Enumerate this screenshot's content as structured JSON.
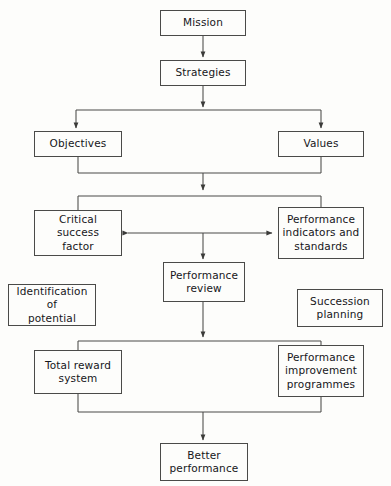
{
  "diagram": {
    "background_color": "#fdfdfb",
    "line_color": "#4a4a48",
    "text_color": "#16161a",
    "nodes": [
      {
        "id": "mission",
        "label": "Mission",
        "x": 160,
        "y": 10,
        "w": 86,
        "h": 26
      },
      {
        "id": "strategies",
        "label": "Strategies",
        "x": 160,
        "y": 60,
        "w": 86,
        "h": 26
      },
      {
        "id": "objectives",
        "label": "Objectives",
        "x": 34,
        "y": 131,
        "w": 88,
        "h": 26
      },
      {
        "id": "values",
        "label": "Values",
        "x": 278,
        "y": 131,
        "w": 86,
        "h": 26
      },
      {
        "id": "csf",
        "label": "Critical  success\nfactor",
        "x": 34,
        "y": 210,
        "w": 88,
        "h": 46
      },
      {
        "id": "indicators",
        "label": "Performance\nindicators and\nstandards",
        "x": 278,
        "y": 207,
        "w": 86,
        "h": 52
      },
      {
        "id": "review",
        "label": "Performance\nreview",
        "x": 163,
        "y": 262,
        "w": 82,
        "h": 40
      },
      {
        "id": "identif",
        "label": "Identification\nof\npotential",
        "x": 8,
        "y": 284,
        "w": 88,
        "h": 42
      },
      {
        "id": "succession",
        "label": "Succession\nplanning",
        "x": 297,
        "y": 289,
        "w": 86,
        "h": 38
      },
      {
        "id": "reward",
        "label": "Total  reward\nsystem",
        "x": 34,
        "y": 350,
        "w": 88,
        "h": 44
      },
      {
        "id": "improvement",
        "label": "Performance\nimprovement\nprogrammes",
        "x": 278,
        "y": 345,
        "w": 86,
        "h": 52
      },
      {
        "id": "better",
        "label": "Better\nperformance",
        "x": 160,
        "y": 443,
        "w": 88,
        "h": 38
      }
    ],
    "connectors": [
      {
        "id": "mission-to-strategies",
        "from": "mission",
        "to": "strategies",
        "style": "straight-down",
        "arrow": "single"
      },
      {
        "id": "strategies-to-split",
        "from": "strategies",
        "to": "objectives-values",
        "style": "fork-down",
        "arrow": "single"
      },
      {
        "id": "objectives-values-merge",
        "from": "objectives-values",
        "to": "csf-indicators",
        "style": "merge-fork",
        "arrow": "single"
      },
      {
        "id": "csf-indicators-link",
        "from": "csf",
        "to": "indicators",
        "style": "horizontal",
        "arrow": "double"
      },
      {
        "id": "link-to-review",
        "from": "csf-indicators-link",
        "to": "review",
        "style": "straight-down",
        "arrow": "single"
      },
      {
        "id": "review-to-split",
        "from": "review",
        "to": "reward-improvement",
        "style": "fork-down",
        "arrow": "single"
      },
      {
        "id": "bottom-merge-to-better",
        "from": "reward-improvement",
        "to": "better",
        "style": "merge-down",
        "arrow": "single"
      }
    ],
    "isolated_nodes": [
      "identif",
      "succession"
    ]
  }
}
